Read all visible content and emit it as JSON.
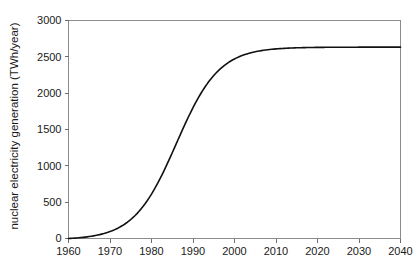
{
  "chart_data": {
    "type": "line",
    "title": "",
    "xlabel": "",
    "ylabel": "nuclear electricity generation (TWh/year)",
    "xlim": [
      1960,
      2040
    ],
    "ylim": [
      0,
      3000
    ],
    "grid": false,
    "legend": null,
    "legend_position": "none",
    "xticks": [
      1960,
      1970,
      1980,
      1990,
      2000,
      2010,
      2020,
      2030,
      2040
    ],
    "xtick_labels": [
      "1960",
      "1970",
      "1980",
      "1990",
      "2000",
      "2010",
      "2020",
      "2030",
      "2040"
    ],
    "yticks": [
      0,
      500,
      1000,
      1500,
      2000,
      2500,
      3000
    ],
    "ytick_labels": [
      "0",
      "500",
      "1000",
      "1500",
      "2000",
      "2500",
      "3000"
    ],
    "series": [
      {
        "name": "nuclear electricity generation",
        "color": "#111111",
        "x": [
          1960,
          1962,
          1964,
          1966,
          1968,
          1970,
          1972,
          1974,
          1976,
          1978,
          1980,
          1982,
          1984,
          1986,
          1988,
          1990,
          1992,
          1994,
          1996,
          1998,
          2000,
          2002,
          2004,
          2006,
          2008,
          2010,
          2012,
          2014,
          2016,
          2018,
          2020,
          2022,
          2024,
          2026,
          2028,
          2030,
          2032,
          2034,
          2036,
          2038,
          2040
        ],
        "values": [
          5,
          10,
          20,
          36,
          62,
          102,
          163,
          250,
          370,
          527,
          722,
          950,
          1197,
          1443,
          1673,
          1873,
          2039,
          2171,
          2272,
          2348,
          2404,
          2444,
          2473,
          2494,
          2509,
          2519,
          2527,
          2532,
          2536,
          2539,
          2541,
          2542,
          2543,
          2544,
          2545,
          2545,
          2546,
          2546,
          2546,
          2547,
          2547
        ]
      }
    ],
    "curve_model": {
      "shape": "logistic",
      "plateau": 2650,
      "inflection_year": 1986,
      "growth_rate": 0.195,
      "start_year": 1960,
      "start_value": 0
    },
    "annotations": []
  },
  "axes": {
    "ylabel_text": "nuclear electricity generation (TWh/year)"
  }
}
